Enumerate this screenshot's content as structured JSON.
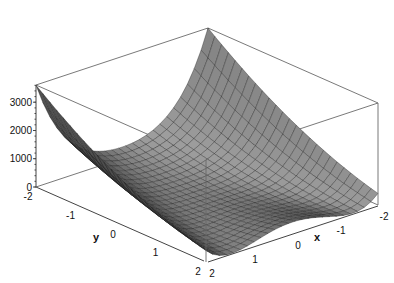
{
  "chart_data": {
    "type": "surface3d",
    "title": "",
    "function": "100*(y - x^2)^2 + (1 - x)^2",
    "x": {
      "label": "x",
      "range": [
        -2,
        2
      ],
      "ticks": [
        "-2",
        "-1",
        "0",
        "1",
        "2"
      ]
    },
    "y": {
      "label": "y",
      "range": [
        -2,
        2
      ],
      "ticks": [
        "-2",
        "-1",
        "0",
        "1",
        "2"
      ]
    },
    "z": {
      "label": "",
      "range": [
        0,
        3609
      ],
      "ticks": [
        "0",
        "1000",
        "2000",
        "3000"
      ]
    },
    "grid_resolution": 25,
    "style": "patch",
    "shading": "gray",
    "box": "framed",
    "annotations": {
      "max_value_corner": {
        "x": -2,
        "y": -2,
        "z": 3609
      },
      "valley": "parabolic valley along y = x^2 with minimum at (1, 1, 0)"
    }
  },
  "colors": {
    "surface_dark": "#3a3a3a",
    "surface_light": "#9a9a9a",
    "mesh_line": "#1e1e1e",
    "box_line": "#6a6a6a",
    "background": "#ffffff"
  }
}
